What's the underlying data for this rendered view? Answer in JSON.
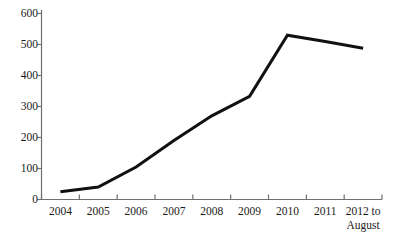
{
  "chart_data": {
    "type": "line",
    "title": "",
    "xlabel": "",
    "ylabel": "",
    "categories": [
      "2004",
      "2005",
      "2006",
      "2007",
      "2008",
      "2009",
      "2010",
      "2011",
      "2012 to August"
    ],
    "values": [
      25,
      40,
      105,
      190,
      270,
      333,
      530,
      510,
      488
    ],
    "series": [
      {
        "name": "",
        "values": [
          25,
          40,
          105,
          190,
          270,
          333,
          530,
          510,
          488
        ]
      }
    ],
    "ylim": [
      0,
      600
    ],
    "y_ticks": [
      0,
      100,
      200,
      300,
      400,
      500,
      600
    ],
    "grid": false,
    "legend": false,
    "line_color": "#111111",
    "line_width": 3
  },
  "axes": {
    "y_tick_labels": [
      "600",
      "500",
      "400",
      "300",
      "200",
      "100",
      "0"
    ],
    "x_tick_labels": [
      {
        "line1": "2004",
        "line2": ""
      },
      {
        "line1": "2005",
        "line2": ""
      },
      {
        "line1": "2006",
        "line2": ""
      },
      {
        "line1": "2007",
        "line2": ""
      },
      {
        "line1": "2008",
        "line2": ""
      },
      {
        "line1": "2009",
        "line2": ""
      },
      {
        "line1": "2010",
        "line2": ""
      },
      {
        "line1": "2011",
        "line2": ""
      },
      {
        "line1": "2012 to",
        "line2": "August"
      }
    ],
    "axis_color": "#6f6f6f"
  }
}
